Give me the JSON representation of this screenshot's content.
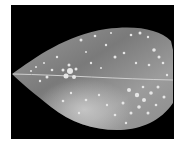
{
  "image": {
    "subject": "leaf with disease spots",
    "background_color": "#000000",
    "frame_color": "#ffffff",
    "leaf_base_color": "#8a8a8a",
    "spot_color": "#e6e6e6"
  }
}
